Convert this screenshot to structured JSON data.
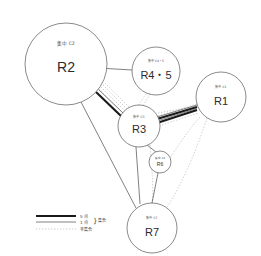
{
  "diagram": {
    "title": "",
    "background_color": "#ffffff",
    "stroke_color": "#58585a",
    "thick_edge_color": "#1a1a1a",
    "dotted_edge_color": "#b4b4b6"
  },
  "nodes": [
    {
      "id": "R2",
      "label": "R2",
      "sublabel": "集中 C2",
      "cx": 66,
      "cy": 64,
      "r": 41
    },
    {
      "id": "R4_5",
      "label": "R4・5",
      "sublabel": "集中 C4・5",
      "cx": 156,
      "cy": 71,
      "r": 24
    },
    {
      "id": "R1",
      "label": "R1",
      "sublabel": "集中 C1",
      "cx": 221,
      "cy": 97,
      "r": 25
    },
    {
      "id": "R3",
      "label": "R3",
      "sublabel": "集中 C3",
      "cx": 139,
      "cy": 126,
      "r": 21
    },
    {
      "id": "R6",
      "label": "R6",
      "sublabel": "集中 C6",
      "cx": 160,
      "cy": 162,
      "r": 11
    },
    {
      "id": "R7",
      "label": "R7",
      "sublabel": "集中 C7",
      "cx": 152,
      "cy": 228,
      "r": 25
    }
  ],
  "edges": [
    {
      "from": "R2",
      "to": "R4_5",
      "style": "thin",
      "weight": "1"
    },
    {
      "from": "R2",
      "to": "R3",
      "style": "thick",
      "weight": "5"
    },
    {
      "from": "R2",
      "to": "R3",
      "style": "dotted",
      "weight": "0"
    },
    {
      "from": "R2",
      "to": "R7",
      "style": "thin",
      "weight": "1"
    },
    {
      "from": "R3",
      "to": "R1",
      "style": "thick",
      "weight": "5"
    },
    {
      "from": "R3",
      "to": "R1",
      "style": "dotted",
      "weight": "0"
    },
    {
      "from": "R4_5",
      "to": "R3",
      "style": "dotted",
      "weight": "0"
    },
    {
      "from": "R3",
      "to": "R7",
      "style": "thin",
      "weight": "1"
    },
    {
      "from": "R3",
      "to": "R6",
      "style": "thin",
      "weight": "1"
    },
    {
      "from": "R6",
      "to": "R7",
      "style": "thin",
      "weight": "1"
    },
    {
      "from": "R1",
      "to": "R7",
      "style": "dotted",
      "weight": "0"
    },
    {
      "from": "R1",
      "to": "R6",
      "style": "dotted",
      "weight": "0"
    }
  ],
  "legend": {
    "rows": [
      {
        "style": "thick",
        "label": "5 点"
      },
      {
        "style": "thin",
        "label": "1 点"
      },
      {
        "style": "dotted",
        "label": ""
      }
    ],
    "brace": "}",
    "group_label": "集合",
    "nongroup_label": "非集合"
  }
}
